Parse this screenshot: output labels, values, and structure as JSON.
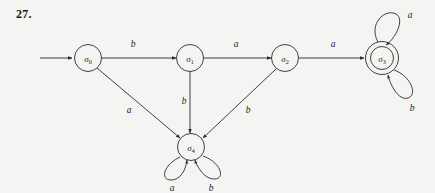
{
  "figure": {
    "exercise_number": "27.",
    "type": "finite-state-automaton-diagram",
    "accent_color": "#2b2b2b",
    "background_color": "#f4f4f3"
  },
  "states": [
    {
      "id": "s0",
      "label": "σ",
      "subscript": "0",
      "text": "σ0",
      "x": 88,
      "y": 58,
      "accepting": false,
      "start": true
    },
    {
      "id": "s1",
      "label": "σ",
      "subscript": "1",
      "text": "σ1",
      "x": 190,
      "y": 58,
      "accepting": false,
      "start": false
    },
    {
      "id": "s2",
      "label": "σ",
      "subscript": "2",
      "text": "σ2",
      "x": 285,
      "y": 58,
      "accepting": false,
      "start": false
    },
    {
      "id": "s3",
      "label": "σ",
      "subscript": "3",
      "text": "σ3",
      "x": 382,
      "y": 58,
      "accepting": true,
      "start": false
    },
    {
      "id": "s4",
      "label": "σ",
      "subscript": "4",
      "text": "σ4",
      "x": 191,
      "y": 147,
      "accepting": false,
      "start": false
    }
  ],
  "transitions": [
    {
      "from": "s0",
      "to": "s1",
      "symbol": "b",
      "label_x": 133,
      "label_y": 44
    },
    {
      "from": "s1",
      "to": "s2",
      "symbol": "a",
      "label_x": 236,
      "label_y": 44
    },
    {
      "from": "s2",
      "to": "s3",
      "symbol": "a",
      "label_x": 333,
      "label_y": 44
    },
    {
      "from": "s0",
      "to": "s4",
      "symbol": "a",
      "label_x": 129,
      "label_y": 110
    },
    {
      "from": "s1",
      "to": "s4",
      "symbol": "b",
      "label_x": 184,
      "label_y": 101
    },
    {
      "from": "s2",
      "to": "s4",
      "symbol": "b",
      "label_x": 248,
      "label_y": 110
    },
    {
      "from": "s3",
      "to": "s3",
      "symbol": "a",
      "label_x": 410,
      "label_y": 15,
      "self_loop": true,
      "position": "top"
    },
    {
      "from": "s3",
      "to": "s3",
      "symbol": "b",
      "label_x": 412,
      "label_y": 108,
      "self_loop": true,
      "position": "bottom"
    },
    {
      "from": "s4",
      "to": "s4",
      "symbol": "a",
      "label_x": 172,
      "label_y": 188,
      "self_loop": true,
      "position": "bottom-left"
    },
    {
      "from": "s4",
      "to": "s4",
      "symbol": "b",
      "label_x": 211,
      "label_y": 188,
      "self_loop": true,
      "position": "bottom-right"
    }
  ],
  "start_arrow": {
    "from_x": 40,
    "to_x": 72,
    "y": 58
  }
}
